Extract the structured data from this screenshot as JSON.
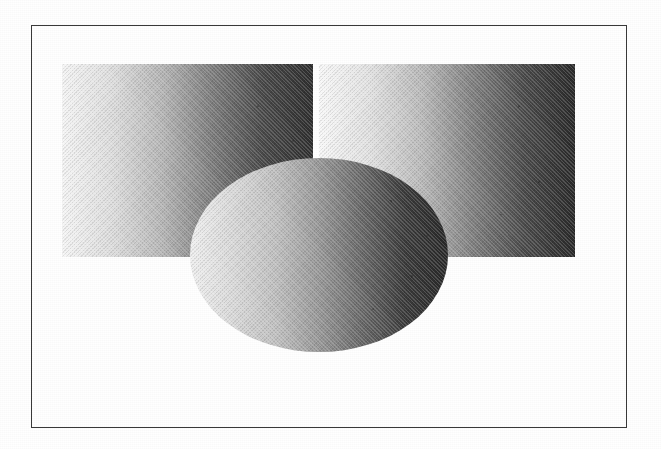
{
  "figure": {
    "title": "Shaded rectangles and sphere with horizontal luminance gradients",
    "background_color": "#ffffff",
    "frame": {
      "name": "figure-border",
      "stroke_color": "#3a3a3a",
      "stroke_width_px": 1.5,
      "x": 31,
      "y": 25,
      "width": 596,
      "height": 403
    },
    "shapes": [
      {
        "id": "rect-left",
        "label": "Left gradient rectangle",
        "type": "rectangle",
        "x": 62,
        "y": 64,
        "width": 251,
        "height": 193,
        "gradient": {
          "direction": "left-to-right",
          "stops": [
            "#f7f7f7",
            "#e0e0e0",
            "#b8b8b8",
            "#7e7e7e",
            "#4a4a4a",
            "#303030"
          ]
        }
      },
      {
        "id": "rect-right",
        "label": "Right gradient rectangle",
        "type": "rectangle",
        "x": 319,
        "y": 64,
        "width": 256,
        "height": 193,
        "gradient": {
          "direction": "left-to-right",
          "stops": [
            "#fafafa",
            "#e4e4e4",
            "#bdbdbd",
            "#828282",
            "#4c4c4c",
            "#2b2b2b"
          ]
        }
      },
      {
        "id": "ellipse-sphere",
        "label": "Shaded sphere (ellipse)",
        "type": "ellipse",
        "cx": 319,
        "cy": 255,
        "rx": 129,
        "ry": 97,
        "gradient": {
          "direction": "left-to-right",
          "stops": [
            "#f2f2f2",
            "#dcdcdc",
            "#c2c2c2",
            "#9a9a9a",
            "#6a6a6a",
            "#3c3c3c",
            "#2a2a2a"
          ]
        }
      }
    ],
    "texture": {
      "kind": "halftone-scan",
      "grain_opacity": 0.35
    }
  }
}
